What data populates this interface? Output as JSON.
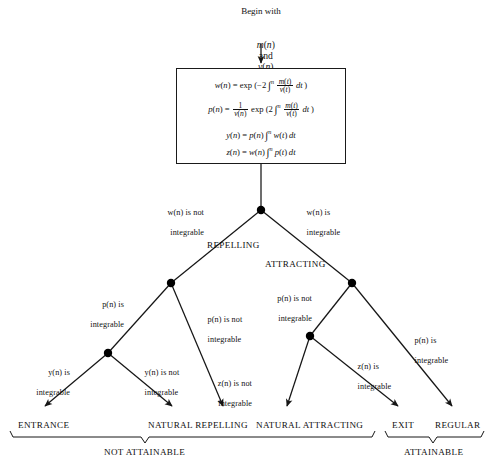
{
  "header": {
    "begin_with": "Begin with",
    "variables_plain": "m(n) and v(n)",
    "variables": [
      {
        "name": "m",
        "arg": "n"
      },
      {
        "conj": "and"
      },
      {
        "name": "v",
        "arg": "n"
      }
    ]
  },
  "formula_box": {
    "lines": [
      {
        "id": "w-def",
        "plain": "w(n) = exp (-2 ∫^n  m(t)/v(t)  dt )",
        "lhs": "w(n)",
        "rhs": "exp (−2 ∫ⁿ m(t)/v(t) dt )"
      },
      {
        "id": "p-def",
        "plain": "p(n) = 1/v(n) exp (2 ∫^n  m(t)/v(t)  dt )",
        "lhs": "p(n)",
        "rhs": "(1/v(n)) exp (2 ∫ⁿ m(t)/v(t) dt )"
      },
      {
        "id": "y-def",
        "plain": "y(n) = p(n) ∫^n w(t) dt",
        "lhs": "y(n)",
        "rhs": "p(n) ∫ⁿ w(t) dt"
      },
      {
        "id": "z-def",
        "plain": "z(n) = w(n) ∫^n p(t) dt",
        "lhs": "z(n)",
        "rhs": "w(n) ∫ⁿ p(t) dt"
      }
    ],
    "symbols": {
      "exp": "exp",
      "equals": "=",
      "integral": "∫",
      "minus_two": "−2",
      "two": "2",
      "dt": "dt",
      "one": "1",
      "m_of_t": "m(t)",
      "v_of_t": "v(t)",
      "v_of_n": "v(n)",
      "n_sup": "n"
    }
  },
  "branches": {
    "level1": [
      {
        "id": "w-not-integrable",
        "line1": "w(n) is not",
        "line2": "integrable",
        "side": "left"
      },
      {
        "id": "w-integrable",
        "line1": "w(n) is",
        "line2": "integrable",
        "side": "right"
      }
    ],
    "level1_categories": [
      {
        "id": "repelling",
        "label": "REPELLING"
      },
      {
        "id": "attracting",
        "label": "ATTRACTING"
      }
    ],
    "level2": [
      {
        "id": "p-integrable-left",
        "line1": "p(n) is",
        "line2": "integrable"
      },
      {
        "id": "p-not-integrable-left",
        "line1": "p(n) is not",
        "line2": "integrable"
      },
      {
        "id": "p-not-integrable-right",
        "line1": "p(n) is not",
        "line2": "integrable"
      },
      {
        "id": "p-integrable-right",
        "line1": "p(n) is",
        "line2": "integrable"
      }
    ],
    "level3": [
      {
        "id": "y-integrable",
        "line1": "y(n) is",
        "line2": "integrable"
      },
      {
        "id": "y-not-integrable",
        "line1": "y(n) is not",
        "line2": "integrable"
      },
      {
        "id": "z-not-integrable",
        "line1": "z(n) is not",
        "line2": "integrable"
      },
      {
        "id": "z-integrable",
        "line1": "z(n) is",
        "line2": "integrable"
      }
    ]
  },
  "terminals": [
    {
      "id": "entrance",
      "label": "ENTRANCE"
    },
    {
      "id": "natural-repelling",
      "label": "NATURAL REPELLING"
    },
    {
      "id": "natural-attracting",
      "label": "NATURAL ATTRACTING"
    },
    {
      "id": "exit",
      "label": "EXIT"
    },
    {
      "id": "regular",
      "label": "REGULAR"
    }
  ],
  "groupings": [
    {
      "id": "not-attainable",
      "label": "NOT ATTAINABLE"
    },
    {
      "id": "attainable",
      "label": "ATTAINABLE"
    }
  ],
  "colors": {
    "line": "#161616",
    "text": "#111111",
    "background": "#ffffff",
    "node": "#000000"
  }
}
